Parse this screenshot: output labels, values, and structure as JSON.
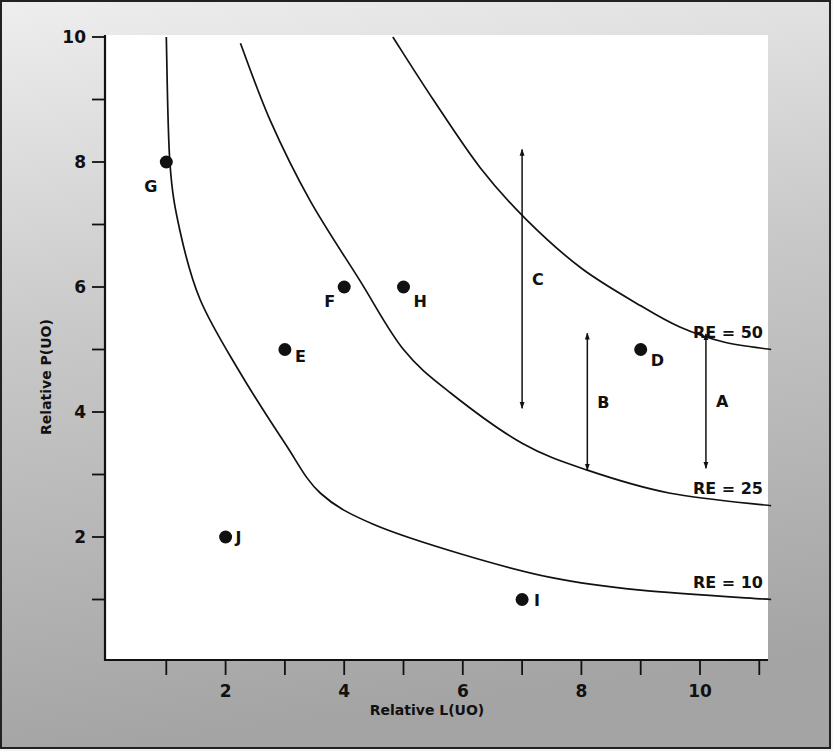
{
  "chart_data": {
    "type": "scatter",
    "title": "",
    "xlabel": "Relative L(UO)",
    "ylabel": "Relative P(UO)",
    "xlim": [
      0,
      11
    ],
    "ylim": [
      0,
      10
    ],
    "grid": false,
    "x_ticks": [
      0,
      1,
      2,
      3,
      4,
      5,
      6,
      7,
      8,
      9,
      10,
      11
    ],
    "x_tick_labels": {
      "2": "2",
      "4": "4",
      "6": "6",
      "8": "8",
      "10": "10"
    },
    "y_ticks": [
      0,
      1,
      2,
      3,
      4,
      5,
      6,
      7,
      8,
      9,
      10
    ],
    "y_tick_labels": {
      "2": "2",
      "4": "4",
      "6": "6",
      "8": "8",
      "10": "10"
    },
    "points": [
      {
        "label": "G",
        "x": 1,
        "y": 8
      },
      {
        "label": "E",
        "x": 3,
        "y": 5
      },
      {
        "label": "F",
        "x": 4,
        "y": 6
      },
      {
        "label": "H",
        "x": 5,
        "y": 6
      },
      {
        "label": "D",
        "x": 9,
        "y": 5
      },
      {
        "label": "J",
        "x": 2,
        "y": 2
      },
      {
        "label": "I",
        "x": 7,
        "y": 1
      }
    ],
    "curves": [
      {
        "name": "RE = 10",
        "points": [
          [
            1.0,
            10.0
          ],
          [
            1.06,
            8.0
          ],
          [
            1.23,
            6.9
          ],
          [
            1.57,
            5.8
          ],
          [
            2.2,
            4.7
          ],
          [
            3.0,
            3.5
          ],
          [
            3.6,
            2.7
          ],
          [
            4.5,
            2.2
          ],
          [
            6.0,
            1.72
          ],
          [
            7.5,
            1.35
          ],
          [
            9.0,
            1.15
          ],
          [
            11.2,
            1.0
          ]
        ]
      },
      {
        "name": "RE = 25",
        "points": [
          [
            2.25,
            9.9
          ],
          [
            2.75,
            8.67
          ],
          [
            3.42,
            7.39
          ],
          [
            4.26,
            6.11
          ],
          [
            5.0,
            5.0
          ],
          [
            5.8,
            4.3
          ],
          [
            7.0,
            3.5
          ],
          [
            8.1,
            3.07
          ],
          [
            9.5,
            2.7
          ],
          [
            11.2,
            2.5
          ]
        ]
      },
      {
        "name": "RE = 50",
        "points": [
          [
            4.82,
            10.0
          ],
          [
            5.5,
            9.0
          ],
          [
            6.3,
            7.9
          ],
          [
            7.08,
            7.07
          ],
          [
            8.0,
            6.3
          ],
          [
            9.0,
            5.7
          ],
          [
            9.66,
            5.36
          ],
          [
            10.4,
            5.12
          ],
          [
            11.2,
            5.0
          ]
        ]
      }
    ],
    "arrows": [
      {
        "label": "C",
        "x": 7.0,
        "y_from": 8.2,
        "y_to": 4.06
      },
      {
        "label": "B",
        "x": 8.1,
        "y_from": 5.26,
        "y_to": 3.07
      },
      {
        "label": "A",
        "x": 10.1,
        "y_from": 5.25,
        "y_to": 3.1
      }
    ]
  },
  "colors": {
    "ink": "#111111",
    "plot_bg": "#ffffff",
    "frame_top": "#e6e6e6",
    "frame_bottom": "#a9a9a9"
  }
}
